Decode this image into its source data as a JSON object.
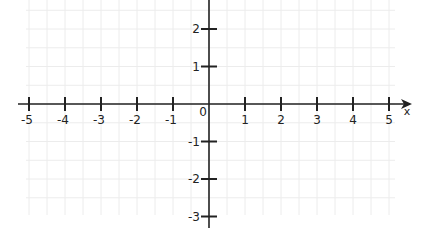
{
  "chart_data": {
    "type": "scatter",
    "title": "",
    "xlabel": "x",
    "ylabel": "",
    "xlim": [
      -5.5,
      5.5
    ],
    "ylim": [
      -3.5,
      2.8
    ],
    "grid": true,
    "grid_step": 0.5,
    "x_ticks": [
      -5,
      -4,
      -3,
      -2,
      -1,
      1,
      2,
      3,
      4,
      5
    ],
    "x_tick_labels": [
      "-5",
      "-4",
      "-3",
      "-2",
      "-1",
      "1",
      "2",
      "3",
      "4",
      "5"
    ],
    "y_ticks": [
      2,
      1,
      -1,
      -2,
      -3
    ],
    "y_tick_labels": [
      "2",
      "1",
      "-1",
      "-2",
      "-3"
    ],
    "origin_label": "0",
    "series": [],
    "colors": {
      "axis": "#222222",
      "grid": "#ececec",
      "background": "#ffffff"
    }
  },
  "layout": {
    "origin_px": [
      209,
      104
    ],
    "x_unit_px": 36,
    "y_unit_px": 37.5
  }
}
